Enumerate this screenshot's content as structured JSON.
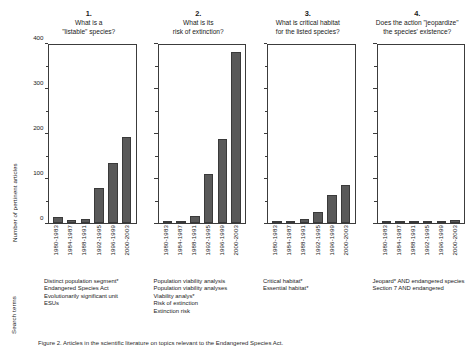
{
  "figure": {
    "ylabel": "Number of pertinent articles",
    "rowlabel": "Search terms",
    "caption": "Figure 2. Articles in the scientific literature on topics relevant to the Endangered Species Act."
  },
  "chart_data": {
    "type": "bar",
    "title": "",
    "xlabel": "",
    "ylabel": "Number of pertinent articles",
    "ylim": [
      0,
      400
    ],
    "yticks": [
      0,
      100,
      200,
      300,
      400
    ],
    "yminor": [
      50,
      150,
      250,
      350
    ],
    "grid": false,
    "legend": "none",
    "categories": [
      "1980-1983",
      "1984-1987",
      "1988-1991",
      "1992-1995",
      "1996-1999",
      "2000-2003"
    ],
    "panels": [
      {
        "number": "1.",
        "question_line1": "What is a",
        "question_line2": "\"listable\" species?",
        "values": [
          13,
          7,
          10,
          78,
          135,
          193
        ],
        "search_terms": [
          "Distinct population segment*",
          "Endangered Species Act",
          "Evolutionarily significant unit",
          "ESUs"
        ]
      },
      {
        "number": "2.",
        "question_line1": "What is its",
        "question_line2": "risk of extinction?",
        "values": [
          1,
          3,
          16,
          110,
          188,
          385
        ],
        "search_terms": [
          "Population viability analysis",
          "Population viability analyses",
          "Viability analys*",
          "Risk of extinction",
          "Extinction risk"
        ]
      },
      {
        "number": "3.",
        "question_line1": "What is critical habitat",
        "question_line2": "for the listed species?",
        "values": [
          1,
          2,
          10,
          25,
          62,
          85
        ],
        "search_terms": [
          "Critical habitat*",
          "Essential habitat*"
        ]
      },
      {
        "number": "4.",
        "question_line1": "Does the action \"jeopardize\"",
        "question_line2": "the species' existence?",
        "values": [
          4,
          3,
          1,
          0,
          0,
          6
        ],
        "search_terms": [
          "Jeopard* AND endangered species",
          "Section 7 AND endangered"
        ]
      }
    ]
  },
  "colors": {
    "bar": "#595959",
    "axis": "#3c3c3c",
    "text": "#1a1a1a"
  }
}
